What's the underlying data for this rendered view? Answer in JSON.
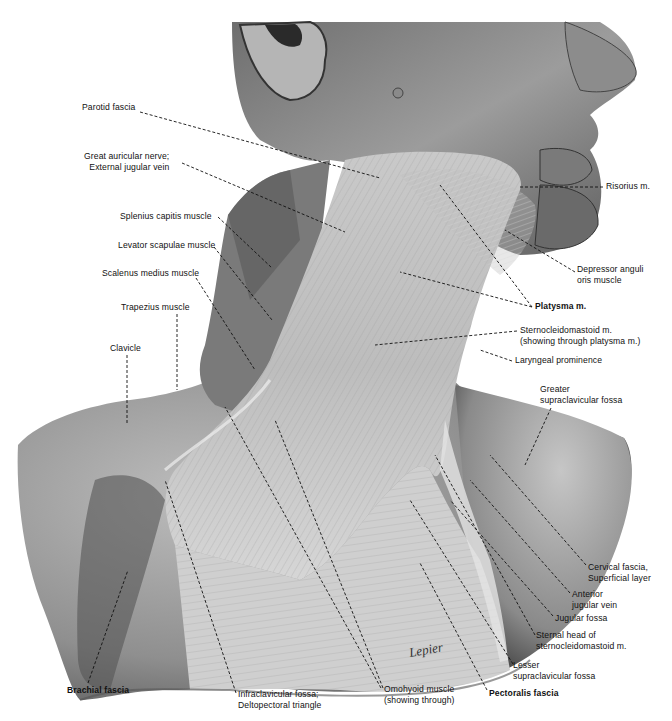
{
  "figure": {
    "signature": "Lepier"
  },
  "labels": {
    "parotid_fascia": {
      "lines": [
        "Parotid fascia"
      ],
      "x": 82,
      "y": 107,
      "align": "left",
      "bold": false
    },
    "great_auricular": {
      "lines": [
        "Great auricular nerve;",
        "External jugular vein"
      ],
      "x": 88,
      "y": 152,
      "align": "right",
      "bold": false
    },
    "splenius_capitis": {
      "lines": [
        "Splenius capitis muscle"
      ],
      "x": 120,
      "y": 211,
      "align": "left",
      "bold": false
    },
    "levator_scapulae": {
      "lines": [
        "Levator scapulae muscle"
      ],
      "x": 118,
      "y": 240,
      "align": "left",
      "bold": false
    },
    "scalenus_medius": {
      "lines": [
        "Scalenus medius muscle"
      ],
      "x": 102,
      "y": 270,
      "align": "left",
      "bold": false
    },
    "trapezius": {
      "lines": [
        "Trapezius muscle"
      ],
      "x": 121,
      "y": 305,
      "align": "left",
      "bold": false
    },
    "clavicle": {
      "lines": [
        "Clavicle"
      ],
      "x": 110,
      "y": 345,
      "align": "left",
      "bold": false
    },
    "risorius": {
      "lines": [
        "Risorius m."
      ],
      "x": 606,
      "y": 184,
      "align": "left",
      "bold": false
    },
    "depressor_anguli": {
      "lines": [
        "Depressor anguli",
        "oris muscle"
      ],
      "x": 576,
      "y": 265,
      "align": "left",
      "bold": false
    },
    "platysma": {
      "lines": [
        "Platysma m."
      ],
      "x": 535,
      "y": 304,
      "align": "left",
      "bold": true
    },
    "sternocleidomastoid": {
      "lines": [
        "Sternocleidomastoid m.",
        "(showing through platysma m.)"
      ],
      "x": 520,
      "y": 324,
      "align": "left",
      "bold": false
    },
    "laryngeal_prominence": {
      "lines": [
        "Laryngeal prominence"
      ],
      "x": 515,
      "y": 355,
      "align": "left",
      "bold": false
    },
    "greater_supraclavicular": {
      "lines": [
        "Greater",
        "supraclavicular fossa"
      ],
      "x": 540,
      "y": 385,
      "align": "left",
      "bold": false
    },
    "cervical_fascia": {
      "lines": [
        "Cervical fascia,",
        "Superficial layer"
      ],
      "x": 588,
      "y": 561,
      "align": "left",
      "bold": false
    },
    "anterior_jugular": {
      "lines": [
        "Anterior",
        "jugular vein"
      ],
      "x": 572,
      "y": 589,
      "align": "left",
      "bold": false
    },
    "jugular_fossa": {
      "lines": [
        "Jugular fossa"
      ],
      "x": 555,
      "y": 612,
      "align": "left",
      "bold": false
    },
    "sternal_head": {
      "lines": [
        "Sternal head of",
        "sternocleidomastoid m."
      ],
      "x": 536,
      "y": 630,
      "align": "left",
      "bold": false
    },
    "lesser_supraclavicular": {
      "lines": [
        "Lesser",
        "supraclavicular fossa"
      ],
      "x": 513,
      "y": 660,
      "align": "left",
      "bold": false
    },
    "pectoralis_fascia": {
      "lines": [
        "Pectoralis fascia"
      ],
      "x": 489,
      "y": 686,
      "align": "left",
      "bold": true
    },
    "omohyoid": {
      "lines": [
        "Omohyoid muscle",
        "(showing through)"
      ],
      "x": 384,
      "y": 684,
      "align": "left",
      "bold": false
    },
    "infraclavicular": {
      "lines": [
        "Infraclavicular fossa;",
        "Deltopectoral triangle"
      ],
      "x": 238,
      "y": 690,
      "align": "left",
      "bold": false
    },
    "brachial_fascia": {
      "lines": [
        "Brachial fascia"
      ],
      "x": 67,
      "y": 685,
      "align": "left",
      "bold": true
    }
  },
  "colors": {
    "background": "#ffffff",
    "skin_dark": "#3a3a3a",
    "skin_mid": "#8a8a8a",
    "skin_light": "#c8c8c8",
    "fascia": "#d9d9d9",
    "text": "#111111"
  }
}
